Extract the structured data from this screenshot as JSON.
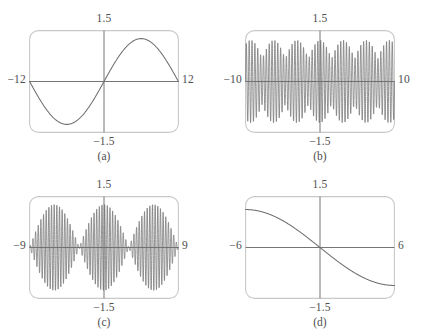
{
  "figure": {
    "kind": "graphing-calculator-viewing-windows",
    "panel_count": 4,
    "stroke_color": "#6e6e6e",
    "frame_color": "#c8c8c8",
    "axis_color": "#767676",
    "label_color": "#4e4e4e",
    "background": "#ffffff"
  },
  "panels": [
    {
      "id": "a",
      "caption": "(a)",
      "x_left_label": "−12",
      "x_right_label": "12",
      "y_top_label": "1.5",
      "y_bottom_label": "−1.5",
      "chart_data": {
        "type": "line",
        "title": "",
        "xlabel": "",
        "ylabel": "",
        "xlim": [
          -12,
          12
        ],
        "ylim": [
          -1.5,
          1.5
        ],
        "grid": false,
        "legend": "none",
        "curve": "sine",
        "amplitude": 1.3,
        "periods_shown": 1,
        "phase": 0,
        "description": "One full sine period across the window: dips to minimum in the left half, crosses zero at the origin rising, peaks in the right half."
      }
    },
    {
      "id": "b",
      "caption": "(b)",
      "x_left_label": "−10",
      "x_right_label": "10",
      "y_top_label": "1.5",
      "y_bottom_label": "−1.5",
      "chart_data": {
        "type": "line",
        "title": "",
        "xlabel": "",
        "ylabel": "",
        "xlim": [
          -10,
          10
        ],
        "ylim": [
          -1.5,
          1.5
        ],
        "grid": false,
        "legend": "none",
        "curve": "amplitude-modulated-oscillation",
        "amplitude": 1.25,
        "carrier_cycles": 52,
        "envelope_nodes": 3,
        "description": "Dense high-frequency oscillation whose amplitude is modulated; envelope narrows at three interior nodes producing a beat appearance, nearly full amplitude elsewhere."
      }
    },
    {
      "id": "c",
      "caption": "(c)",
      "x_left_label": "−9",
      "x_right_label": "9",
      "y_top_label": "1.5",
      "y_bottom_label": "−1.5",
      "chart_data": {
        "type": "line",
        "title": "",
        "xlabel": "",
        "ylabel": "",
        "xlim": [
          -9,
          9
        ],
        "ylim": [
          -1.5,
          1.5
        ],
        "grid": false,
        "legend": "none",
        "curve": "beat-envelope-oscillation",
        "amplitude": 1.3,
        "carrier_cycles": 56,
        "envelope_nodes": 2,
        "description": "High-frequency oscillation with a large central lobe peaking at x = 0, pinching to near-zero nodes on either side, then smaller outer lobes at the window edges."
      }
    },
    {
      "id": "d",
      "caption": "(d)",
      "x_left_label": "−6",
      "x_right_label": "6",
      "y_top_label": "1.5",
      "y_bottom_label": "−1.5",
      "chart_data": {
        "type": "line",
        "title": "",
        "xlabel": "",
        "ylabel": "",
        "xlim": [
          -6,
          6
        ],
        "ylim": [
          -1.5,
          1.5
        ],
        "grid": false,
        "legend": "none",
        "curve": "negative-sine-half-period",
        "amplitude": 1.15,
        "periods_shown": 0.5,
        "description": "Monotonically decreasing S-shaped curve: starts high near the top-left, flattens, passes through the origin, and levels off low near the bottom-right."
      }
    }
  ]
}
